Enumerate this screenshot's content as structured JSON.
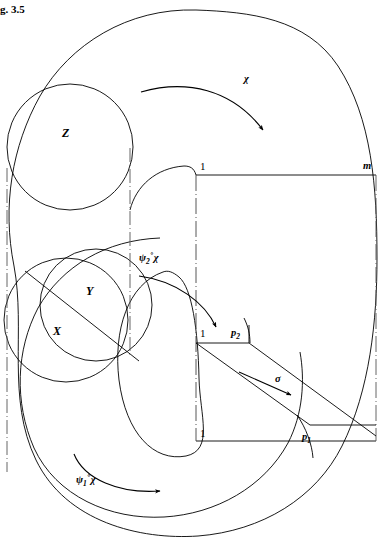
{
  "figure": {
    "caption": "g. 3.5",
    "background_color": "#ffffff",
    "stroke_color": "#000000",
    "width": 385,
    "height": 540
  },
  "sets": [
    {
      "id": "Z",
      "label": "Z",
      "x": 62,
      "y": 133
    },
    {
      "id": "Y",
      "label": "Y",
      "x": 88,
      "y": 291
    },
    {
      "id": "X",
      "label": "X",
      "x": 55,
      "y": 331
    }
  ],
  "maps": [
    {
      "id": "chi",
      "label": "χ",
      "x": 247,
      "y": 81,
      "arrow": "top-arc"
    },
    {
      "id": "psi2_chi",
      "label_pre": "ψ",
      "label_sub": "2",
      "label_circ": "∘",
      "label_post": "χ",
      "x": 147,
      "y": 258,
      "arrow": "mid-arc"
    },
    {
      "id": "psi1_chi",
      "label_pre": "ψ",
      "label_sub": "1",
      "label_circ": "∘",
      "label_post": "χ",
      "x": 82,
      "y": 472,
      "arrow": "bottom-arc"
    },
    {
      "id": "sigma",
      "label": "σ",
      "x": 276,
      "y": 378,
      "arrow": "sigma-straight"
    }
  ],
  "points": [
    {
      "id": "one-top",
      "label": "1",
      "x": 200,
      "y": 162,
      "style": "upright"
    },
    {
      "id": "one-mid",
      "label": "1",
      "x": 200,
      "y": 332,
      "style": "upright"
    },
    {
      "id": "one-bottom",
      "label": "1",
      "x": 200,
      "y": 432,
      "style": "upright"
    },
    {
      "id": "m",
      "label": "m",
      "x": 363,
      "y": 163,
      "style": "italic"
    },
    {
      "id": "p2",
      "label": "p",
      "sub": "2",
      "x": 232,
      "y": 331,
      "style": "italic"
    },
    {
      "id": "p1",
      "label": "p",
      "sub": "1",
      "x": 303,
      "y": 434,
      "style": "italic"
    }
  ],
  "geometry": {
    "outer_blob": "M 196 10 C 120 10 62 46 34 96 C 8 144 2 204 14 264 C 26 330 8 398 36 458 C 64 520 140 540 196 536 C 264 532 318 500 344 448 C 372 392 376 320 376 260 C 376 190 374 120 340 66 C 310 20 250 10 196 10 Z",
    "inner_blob": "M 160 238 C 110 238 66 262 42 304 C 18 346 14 398 32 444 C 52 492 108 518 160 516 C 214 514 262 488 286 444 C 306 406 306 366 300 340",
    "z_circle": {
      "cx": 70,
      "cy": 147,
      "r": 63
    },
    "xy_circle_left": {
      "cx": 70,
      "cy": 318,
      "r": 62
    },
    "xy_circle_right": {
      "cx": 98,
      "cy": 306,
      "r": 56
    },
    "xy_chord": "M 27 272 L 140 360",
    "center_oval": "M 158 276 C 122 292 112 340 120 388 C 128 436 156 462 186 458 C 212 454 198 420 198 380 C 198 330 194 292 180 280 C 172 274 164 274 158 276 Z",
    "rect_top_line": "M 196 175 L 375 175",
    "rect_right_line": "M 375 175 L 375 441",
    "rect_bottom_line": "M 196 441 L 375 441",
    "vertical_dashdot_left": "M 7 170 L 7 470",
    "vertical_dashdot_center": "M 196 175 L 196 441",
    "vertical_dashdot_right": "M 375 175 L 375 441",
    "vertical_dashdot_mid": "M 130 150 L 130 352",
    "sigma_band_top": "M 196 343 L 248 343 L 375 435",
    "sigma_band_bottom": "M 196 343 L 314 428 L 375 428",
    "p2_tick": "M 248 325 L 248 343",
    "p1_tick": "M 300 420 L 314 452"
  },
  "arcs": {
    "chi_arrow": "M 120 88 C 170 74 226 82 258 122",
    "psi2_arrow": "M 112 272 C 158 276 200 300 216 330",
    "psi1_arrow": "M 54 432 C 70 476 110 498 160 494",
    "sigma_arrow": "M 212 368 L 296 404"
  }
}
